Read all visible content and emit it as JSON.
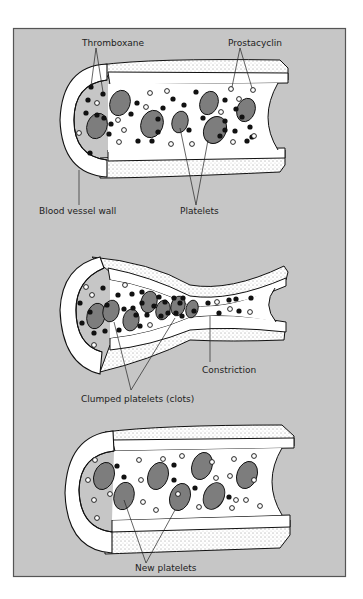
{
  "figure": {
    "type": "scientific-illustration",
    "colors": {
      "panel_background": "#c6c6c6",
      "panel_border": "#555555",
      "vessel_wall": "#ffffff",
      "platelet_fill": "#7d7d7d",
      "thromboxane_dot": "#111111",
      "prostacyclin_dot": "#ffffff",
      "outline": "#111111"
    }
  },
  "panels": [
    {
      "id": "normal-vessel",
      "labels": {
        "thromboxane": "Thromboxane",
        "prostacyclin": "Prostacyclin",
        "vessel_wall": "Blood vessel wall",
        "platelets": "Platelets"
      }
    },
    {
      "id": "constricted-vessel",
      "labels": {
        "constriction": "Constriction",
        "clots": "Clumped platelets (clots)"
      }
    },
    {
      "id": "recovered-vessel",
      "labels": {
        "new_platelets": "New platelets"
      }
    }
  ],
  "legend_semantics": {
    "black_dot": "Thromboxane",
    "white_dot": "Prostacyclin",
    "gray_oval": "Platelet"
  }
}
